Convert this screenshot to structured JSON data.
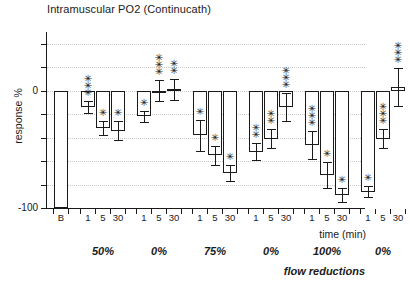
{
  "chart_data": {
    "type": "bar",
    "title": "Intramuscular PO2 (Continucath)",
    "xlabel": "time (min)",
    "ylabel": "response %",
    "ylim": [
      -100,
      50
    ],
    "ytick_values": [
      -100,
      -80,
      -60,
      -40,
      -20,
      0,
      20,
      40
    ],
    "ytick_labels": [
      "-100",
      "",
      "",
      "",
      "",
      "0",
      "",
      ""
    ],
    "grid": "horizontal-dotted",
    "legend": "none",
    "categories": [
      "B",
      "1",
      "5",
      "30",
      "1",
      "5",
      "30",
      "1",
      "5",
      "30",
      "1",
      "5",
      "30",
      "1",
      "5",
      "30",
      "1",
      "5",
      "30"
    ],
    "values": [
      0,
      -14,
      -32,
      -34,
      -22,
      0,
      1,
      -38,
      -55,
      -70,
      -52,
      -41,
      -14,
      -46,
      -72,
      -89,
      -86,
      -41,
      3
    ],
    "errors": [
      0,
      5,
      6,
      8,
      5,
      9,
      9,
      13,
      8,
      7,
      7,
      8,
      12,
      12,
      11,
      6,
      5,
      8,
      16
    ],
    "significance": [
      "",
      "***",
      "*",
      "*",
      "*",
      "***",
      "**",
      "*",
      "*",
      "*",
      "**",
      "**",
      "***",
      "***",
      "*",
      "*",
      "*",
      "***",
      "***"
    ],
    "annotation": "flow reductions",
    "groups": [
      {
        "label": "B",
        "bars": 1
      },
      {
        "label": "50%",
        "bars": 3
      },
      {
        "label": "0%",
        "bars": 3
      },
      {
        "label": "75%",
        "bars": 3
      },
      {
        "label": "0%",
        "bars": 3
      },
      {
        "label": "100%",
        "bars": 3
      },
      {
        "label": "0%",
        "bars": 3
      }
    ],
    "group_labels": [
      "50%",
      "0%",
      "75%",
      "0%",
      "100%",
      "0%"
    ]
  },
  "axis": {
    "y_label_zero": "0",
    "y_label_min": "-100",
    "x_title": "time (min)"
  }
}
